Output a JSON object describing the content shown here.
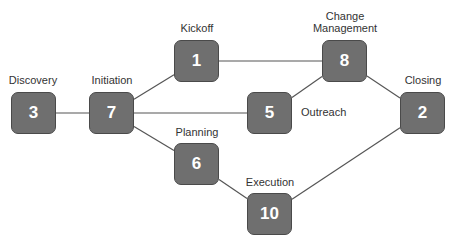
{
  "diagram": {
    "type": "network-diagram",
    "colors": {
      "node_fill": "#6f6f6f",
      "node_border": "#4a4a4a",
      "node_text": "#ffffff",
      "edge": "#555555",
      "label": "#333333"
    },
    "nodes": [
      {
        "id": "discovery",
        "number": "3",
        "label": "Discovery"
      },
      {
        "id": "initiation",
        "number": "7",
        "label": "Initiation"
      },
      {
        "id": "kickoff",
        "number": "1",
        "label": "Kickoff"
      },
      {
        "id": "change-management",
        "number": "8",
        "label": "Change\nManagement"
      },
      {
        "id": "outreach",
        "number": "5",
        "label": "Outreach"
      },
      {
        "id": "closing",
        "number": "2",
        "label": "Closing"
      },
      {
        "id": "planning",
        "number": "6",
        "label": "Planning"
      },
      {
        "id": "execution",
        "number": "10",
        "label": "Execution"
      }
    ],
    "edges": [
      [
        "discovery",
        "initiation"
      ],
      [
        "initiation",
        "kickoff"
      ],
      [
        "initiation",
        "outreach"
      ],
      [
        "initiation",
        "planning"
      ],
      [
        "kickoff",
        "change-management"
      ],
      [
        "outreach",
        "change-management"
      ],
      [
        "change-management",
        "closing"
      ],
      [
        "planning",
        "execution"
      ],
      [
        "execution",
        "closing"
      ]
    ]
  }
}
